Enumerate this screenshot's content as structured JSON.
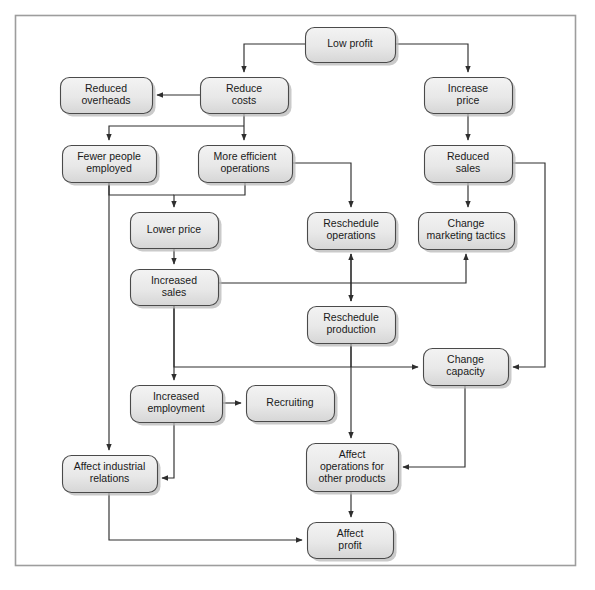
{
  "figure": {
    "caption": "",
    "frame": {
      "border_color": "#9a9a9a",
      "background": "#ffffff"
    }
  },
  "style": {
    "node_fill_top": "#f0f0f0",
    "node_fill_bottom": "#d9d9d9",
    "node_stroke": "#4a4a4a",
    "node_shadow": "#b8b8b8",
    "connector_color": "#3a3a3a",
    "text_color": "#1a1a1a"
  },
  "nodes": [
    {
      "id": "low-profit",
      "label_line1": "Low profit",
      "label_line2": "",
      "label_line3": "",
      "x": 305,
      "y": 27,
      "w": 90,
      "h": 35
    },
    {
      "id": "reduce-costs",
      "label_line1": "Reduce",
      "label_line2": "costs",
      "label_line3": "",
      "x": 200,
      "y": 77,
      "w": 88,
      "h": 36
    },
    {
      "id": "reduced-overheads",
      "label_line1": "Reduced",
      "label_line2": "overheads",
      "label_line3": "",
      "x": 60,
      "y": 77,
      "w": 92,
      "h": 36
    },
    {
      "id": "increase-price",
      "label_line1": "Increase",
      "label_line2": "price",
      "label_line3": "",
      "x": 424,
      "y": 77,
      "w": 88,
      "h": 36
    },
    {
      "id": "fewer-people",
      "label_line1": "Fewer people",
      "label_line2": "employed",
      "label_line3": "",
      "x": 62,
      "y": 145,
      "w": 94,
      "h": 37
    },
    {
      "id": "more-efficient",
      "label_line1": "More efficient",
      "label_line2": "operations",
      "label_line3": "",
      "x": 198,
      "y": 145,
      "w": 94,
      "h": 37
    },
    {
      "id": "reduced-sales",
      "label_line1": "Reduced",
      "label_line2": "sales",
      "label_line3": "",
      "x": 424,
      "y": 145,
      "w": 88,
      "h": 37
    },
    {
      "id": "lower-price",
      "label_line1": "Lower price",
      "label_line2": "",
      "label_line3": "",
      "x": 130,
      "y": 212,
      "w": 88,
      "h": 36
    },
    {
      "id": "reschedule-ops",
      "label_line1": "Reschedule",
      "label_line2": "operations",
      "label_line3": "",
      "x": 307,
      "y": 212,
      "w": 88,
      "h": 37
    },
    {
      "id": "change-marketing",
      "label_line1": "Change",
      "label_line2": "marketing tactics",
      "label_line3": "",
      "x": 418,
      "y": 212,
      "w": 96,
      "h": 37
    },
    {
      "id": "increased-sales",
      "label_line1": "Increased",
      "label_line2": "sales",
      "label_line3": "",
      "x": 130,
      "y": 269,
      "w": 88,
      "h": 36
    },
    {
      "id": "reschedule-prod",
      "label_line1": "Reschedule",
      "label_line2": "production",
      "label_line3": "",
      "x": 307,
      "y": 306,
      "w": 88,
      "h": 37
    },
    {
      "id": "change-capacity",
      "label_line1": "Change",
      "label_line2": "capacity",
      "label_line3": "",
      "x": 423,
      "y": 348,
      "w": 85,
      "h": 37
    },
    {
      "id": "increased-employ",
      "label_line1": "Increased",
      "label_line2": "employment",
      "label_line3": "",
      "x": 130,
      "y": 385,
      "w": 92,
      "h": 37
    },
    {
      "id": "recruiting",
      "label_line1": "Recruiting",
      "label_line2": "",
      "label_line3": "",
      "x": 246,
      "y": 385,
      "w": 88,
      "h": 36
    },
    {
      "id": "affect-industrial",
      "label_line1": "Affect industrial",
      "label_line2": "relations",
      "label_line3": "",
      "x": 62,
      "y": 455,
      "w": 95,
      "h": 37
    },
    {
      "id": "affect-operations",
      "label_line1": "Affect",
      "label_line2": "operations for",
      "label_line3": "other products",
      "x": 306,
      "y": 443,
      "w": 92,
      "h": 48
    },
    {
      "id": "affect-profit",
      "label_line1": "Affect",
      "label_line2": "profit",
      "label_line3": "",
      "x": 307,
      "y": 522,
      "w": 86,
      "h": 36
    }
  ],
  "edges": [
    {
      "id": "low-profit-to-reduce-costs",
      "from": "low-profit",
      "to": "reduce-costs"
    },
    {
      "id": "low-profit-to-increase-price",
      "from": "low-profit",
      "to": "increase-price"
    },
    {
      "id": "reduce-costs-to-reduced-overheads",
      "from": "reduce-costs",
      "to": "reduced-overheads"
    },
    {
      "id": "reduce-costs-to-more-efficient",
      "from": "reduce-costs",
      "to": "more-efficient"
    },
    {
      "id": "reduce-costs-to-fewer-people",
      "from": "reduce-costs",
      "to": "fewer-people"
    },
    {
      "id": "increase-price-to-reduced-sales",
      "from": "increase-price",
      "to": "reduced-sales"
    },
    {
      "id": "reduced-sales-to-change-marketing",
      "from": "reduced-sales",
      "to": "change-marketing"
    },
    {
      "id": "reduced-sales-to-change-capacity",
      "from": "reduced-sales",
      "to": "change-capacity"
    },
    {
      "id": "more-efficient-to-lower-price",
      "from": "more-efficient",
      "to": "lower-price"
    },
    {
      "id": "fewer-people-to-lower-price",
      "from": "fewer-people",
      "to": "lower-price"
    },
    {
      "id": "more-efficient-to-reschedule-ops",
      "from": "more-efficient",
      "to": "reschedule-ops"
    },
    {
      "id": "fewer-people-to-affect-industrial",
      "from": "fewer-people",
      "to": "affect-industrial"
    },
    {
      "id": "lower-price-to-increased-sales",
      "from": "lower-price",
      "to": "increased-sales"
    },
    {
      "id": "increased-sales-to-change-marketing",
      "from": "increased-sales",
      "to": "change-marketing"
    },
    {
      "id": "reschedule-ops-to-reschedule-prod",
      "from": "reschedule-ops",
      "to": "reschedule-prod"
    },
    {
      "id": "reschedule-prod-to-reschedule-ops",
      "from": "reschedule-prod",
      "to": "reschedule-ops"
    },
    {
      "id": "increased-sales-to-change-capacity",
      "from": "increased-sales",
      "to": "change-capacity"
    },
    {
      "id": "reschedule-prod-to-change-capacity",
      "from": "reschedule-prod",
      "to": "change-capacity"
    },
    {
      "id": "increased-sales-to-increased-employ",
      "from": "increased-sales",
      "to": "increased-employ"
    },
    {
      "id": "increased-employ-to-recruiting",
      "from": "increased-employ",
      "to": "recruiting"
    },
    {
      "id": "increased-employ-to-affect-industrial",
      "from": "increased-employ",
      "to": "affect-industrial"
    },
    {
      "id": "reschedule-prod-to-affect-operations",
      "from": "reschedule-prod",
      "to": "affect-operations"
    },
    {
      "id": "change-capacity-to-affect-operations",
      "from": "change-capacity",
      "to": "affect-operations"
    },
    {
      "id": "affect-operations-to-affect-profit",
      "from": "affect-operations",
      "to": "affect-profit"
    },
    {
      "id": "affect-industrial-to-affect-profit",
      "from": "affect-industrial",
      "to": "affect-profit"
    }
  ]
}
